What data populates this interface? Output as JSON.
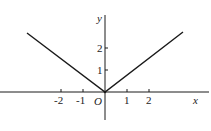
{
  "figure": {
    "type": "function-graph",
    "axes": {
      "x_label": "x",
      "y_label": "y",
      "origin_label": "O",
      "x_ticks": [
        "-2",
        "-1",
        "1",
        "2"
      ],
      "y_ticks": [
        "1",
        "2"
      ]
    },
    "curve": {
      "shape": "V",
      "vertex": [
        0,
        0
      ],
      "left_end": [
        -3.5,
        2.7
      ],
      "right_end": [
        3.5,
        2.7
      ]
    },
    "colors": {
      "line": "#1a1a1a",
      "text": "#222222",
      "background": "#ffffff"
    }
  }
}
